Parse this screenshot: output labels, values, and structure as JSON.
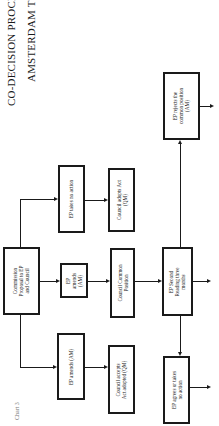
{
  "title": {
    "line1": "CO-DECISION PROCEDURE",
    "line2": "AMSTERDAM TREATY"
  },
  "caption": "Chart 3",
  "nodes": {
    "commission": "Commission Proposal to EP and Council",
    "ep_no_action": "EP takes no action",
    "council_adopts_act": "Council adopts Act (QM)",
    "ep_amends_mid": "EP amends (AM)",
    "council_common_position": "Council Common Position",
    "ep_second_reading": "EP Second Reading three months",
    "ep_rejects": "EP rejects the common position (AM)",
    "ep_amends_bottom": "EP amends (AM)",
    "council_accepts": "Council accepts Act adopted (QM)",
    "ep_agrees": "EP agrees or takes no action"
  },
  "node_lines": {
    "commission": [
      "Commission",
      "Proposal to EP",
      "and Council"
    ],
    "ep_amends_mid": [
      "EP",
      "amends",
      "(AM)"
    ],
    "council_common_position": [
      "Council Common",
      "Position"
    ],
    "ep_second_reading": [
      "EP Second",
      "Reading three",
      "months"
    ],
    "ep_rejects": [
      "EP rejects the",
      "common position",
      "(AM)"
    ],
    "council_adopts_act": [
      "Council adopts Act",
      "(QM)"
    ],
    "council_accepts": [
      "Council accepts",
      "Act adopted (QM)"
    ],
    "ep_agrees": [
      "EP agrees or takes",
      "no action"
    ]
  },
  "colors": {
    "ink": "#1a1a1a",
    "background": "#ffffff",
    "caption": "#777777"
  }
}
